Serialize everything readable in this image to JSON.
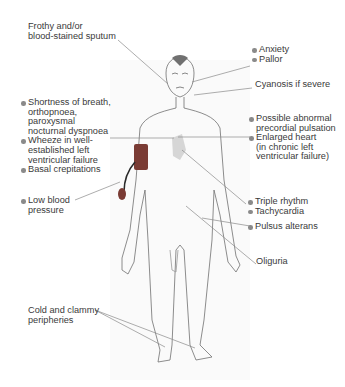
{
  "diagram": {
    "colors": {
      "text": "#3a3a3a",
      "line": "#8a8a8a",
      "cuff": "#7a3b34",
      "heart": "#d6d6d6",
      "bullet": "#8a8a8a"
    },
    "labels": {
      "sputum": [
        "Frothy and/or",
        "blood-stained sputum"
      ],
      "anxiety": "Anxiety",
      "pallor": "Pallor",
      "cyanosis": "Cyanosis if severe",
      "breath": [
        "Shortness of breath,",
        "orthopnoea,",
        "paroxysmal",
        "nocturnal dyspnoea"
      ],
      "wheeze": [
        "Wheeze in well-",
        "established left",
        "ventricular failure"
      ],
      "crepitations": "Basal crepitations",
      "pulsation": [
        "Possible abnormal",
        "precordial pulsation"
      ],
      "heart": [
        "Enlarged heart",
        "(in chronic left",
        "ventricular failure)"
      ],
      "bp": [
        "Low blood",
        "pressure"
      ],
      "triple": "Triple rhythm",
      "tachy": "Tachycardia",
      "pulsus": "Pulsus alterans",
      "oliguria": "Oliguria",
      "cold": [
        "Cold and clammy",
        "peripheries"
      ]
    }
  }
}
